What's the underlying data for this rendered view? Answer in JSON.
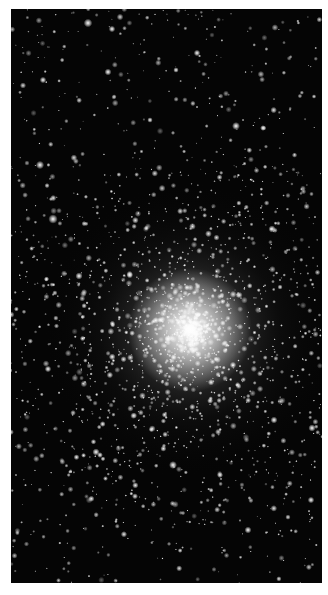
{
  "image": {
    "subject": "Globular star cluster",
    "description": "Black-and-white astronomical photograph of a dense globular star cluster with a bright core and scattered field stars",
    "frame": {
      "x": 11,
      "y": 9,
      "width": 311,
      "height": 574
    },
    "background_color": "#050505",
    "page_color": "#ffffff",
    "core": {
      "x": 190,
      "y": 330,
      "radius": 62,
      "halo_radius": 150
    },
    "star_field": {
      "seed": 7,
      "field_stars": 900,
      "cluster_stars": 1500
    },
    "bright_stars": [
      [
        88,
        23,
        2.4
      ],
      [
        112,
        29,
        1.8
      ],
      [
        197,
        53,
        1.8
      ],
      [
        236,
        126,
        2.2
      ],
      [
        108,
        72,
        1.9
      ],
      [
        43,
        80,
        1.8
      ],
      [
        40,
        165,
        2.3
      ],
      [
        53,
        219,
        2.6
      ],
      [
        272,
        229,
        2.0
      ],
      [
        79,
        276,
        2.0
      ],
      [
        48,
        369,
        1.8
      ],
      [
        96,
        452,
        2.0
      ],
      [
        173,
        465,
        2.2
      ],
      [
        274,
        420,
        1.9
      ],
      [
        312,
        428,
        2.0
      ],
      [
        311,
        500,
        1.8
      ],
      [
        248,
        530,
        1.9
      ],
      [
        220,
        475,
        1.7
      ],
      [
        233,
        365,
        1.8
      ],
      [
        160,
        320,
        1.6
      ],
      [
        263,
        128,
        1.6
      ],
      [
        150,
        120,
        1.5
      ],
      [
        100,
        455,
        1.6
      ],
      [
        176,
        70,
        1.5
      ]
    ]
  }
}
